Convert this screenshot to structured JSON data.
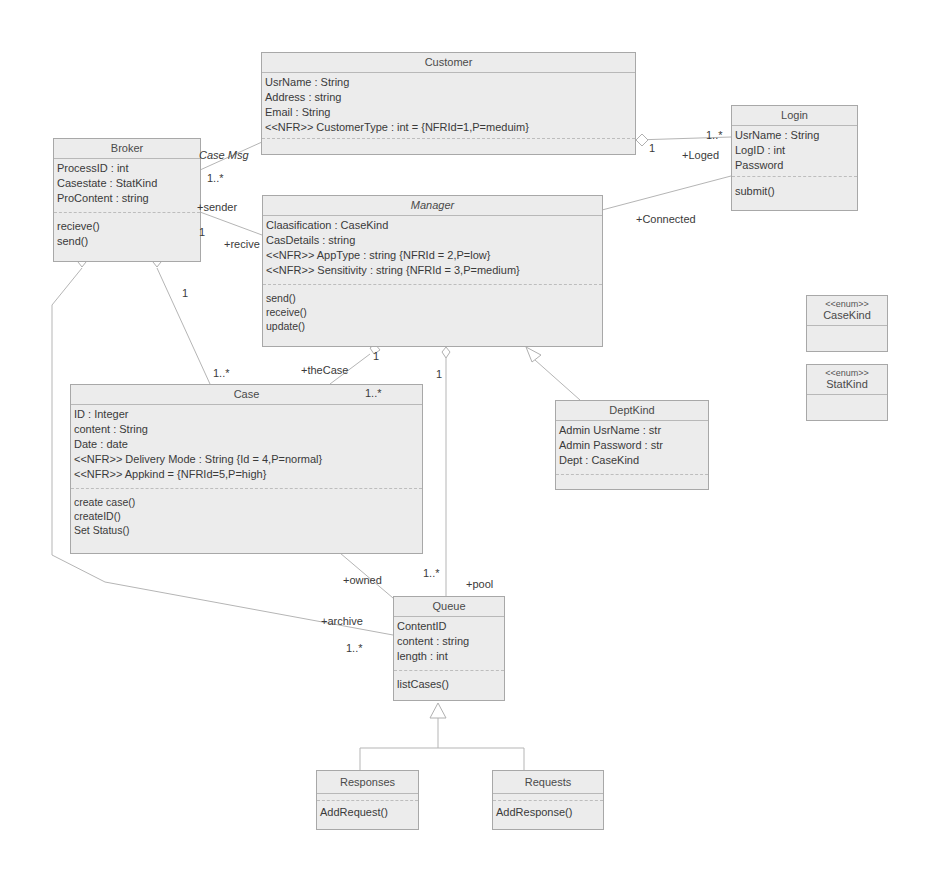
{
  "classes": {
    "customer": {
      "name": "Customer",
      "attributes": [
        "UsrName : String",
        "Address : string",
        "Email : String",
        "<<NFR>> CustomerType : int = {NFRId=1,P=meduim}"
      ],
      "operations": []
    },
    "login": {
      "name": "Login",
      "attributes": [
        "UsrName : String",
        "LogID : int",
        "Password"
      ],
      "operations": [
        "submit()"
      ]
    },
    "broker": {
      "name": "Broker",
      "attributes": [
        "ProcessID : int",
        "Casestate : StatKind",
        "ProContent : string"
      ],
      "operations": [
        "recieve()",
        "send()"
      ]
    },
    "manager": {
      "name": "Manager",
      "attributes": [
        "Claasification : CaseKind",
        "CasDetails : string",
        "<<NFR>> AppType : string {NFRId = 2,P=low}",
        "<<NFR>> Sensitivity : string {NFRId = 3,P=medium}"
      ],
      "operations": [
        "send()",
        "receive()",
        "update()"
      ]
    },
    "case": {
      "name": "Case",
      "attributes": [
        "ID : Integer",
        "content : String",
        "Date : date",
        "<<NFR>> Delivery Mode : String {Id = 4,P=normal}",
        "<<NFR>> Appkind = {NFRId=5,P=high}"
      ],
      "operations": [
        "create case()",
        "createID()",
        "Set Status()"
      ]
    },
    "deptkind": {
      "name": "DeptKind",
      "attributes": [
        "Admin UsrName : str",
        "Admin Password : str",
        "Dept : CaseKind"
      ],
      "operations": []
    },
    "casekind": {
      "stereotype": "<<enum>>",
      "name": "CaseKind"
    },
    "statkind": {
      "stereotype": "<<enum>>",
      "name": "StatKind"
    },
    "queue": {
      "name": "Queue",
      "attributes": [
        "ContentID",
        "content : string",
        "length : int"
      ],
      "operations": [
        "listCases()"
      ]
    },
    "responses": {
      "name": "Responses",
      "operations": [
        "AddRequest()"
      ]
    },
    "requests": {
      "name": "Requests",
      "operations": [
        "AddResponse()"
      ]
    }
  },
  "labels": {
    "case_msg": "Case Msg",
    "broker_mult_customer": "1..*",
    "sender": "+sender",
    "broker_mult_manager": "1",
    "recive": "+recive",
    "customer_mult_login": "1",
    "login_mult": "1..*",
    "loged": "+Loged",
    "connected": "+Connected",
    "broker_case_1": "1",
    "broker_case_many": "1..*",
    "manager_case_1": "1",
    "thecase": "+theCase",
    "case_mult": "1..*",
    "manager_queue_1": "1",
    "queue_pool_mult": "1..*",
    "pool": "+pool",
    "owned": "+owned",
    "archive": "+archive",
    "archive_mult": "1..*"
  }
}
